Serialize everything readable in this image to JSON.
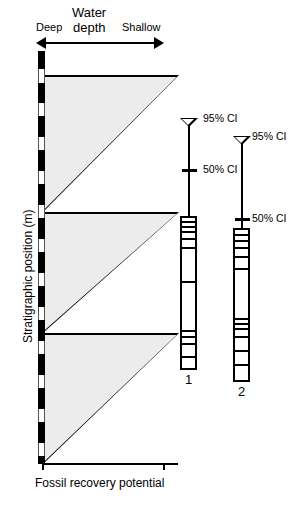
{
  "figure": {
    "axes": {
      "x_label": "Fossil recovery potential",
      "y_label": "Stratigraphic position (m)",
      "gradient_label_line1": "Water",
      "gradient_label_line2": "depth",
      "gradient_left": "Deep",
      "gradient_right": "Shallow"
    },
    "confidence_intervals": [
      {
        "id": "section-1",
        "ci95": "95% CI",
        "ci50": "50% CI"
      },
      {
        "id": "section-2",
        "ci95": "95% CI",
        "ci50": "50% CI"
      }
    ],
    "sections": [
      {
        "label": "1"
      },
      {
        "label": "2"
      }
    ]
  },
  "chart_data": {
    "type": "area",
    "title": "",
    "xlabel": "Fossil recovery potential",
    "ylabel": "Stratigraphic position (m)",
    "grid": false,
    "legend": "none",
    "annotations": [
      "Water depth",
      "Deep",
      "Shallow",
      "95% CI",
      "50% CI"
    ],
    "series": [
      {
        "name": "Fossil recovery potential (sawtooth cycle 1)",
        "type": "sawtooth-triangle",
        "top_y": 75,
        "base_y": 211,
        "max_x": 135
      },
      {
        "name": "Fossil recovery potential (sawtooth cycle 2)",
        "type": "sawtooth-triangle",
        "top_y": 212,
        "base_y": 332,
        "max_x": 135
      },
      {
        "name": "Fossil recovery potential (sawtooth cycle 3)",
        "type": "sawtooth-triangle",
        "top_y": 333,
        "base_y": 463,
        "max_x": 135
      }
    ],
    "strat_column_segments": [
      {
        "tone": "dark",
        "top": 0,
        "height": 18
      },
      {
        "tone": "light",
        "top": 18,
        "height": 14
      },
      {
        "tone": "dark",
        "top": 32,
        "height": 20
      },
      {
        "tone": "light",
        "top": 52,
        "height": 13
      },
      {
        "tone": "dark",
        "top": 65,
        "height": 21
      },
      {
        "tone": "light",
        "top": 86,
        "height": 13
      },
      {
        "tone": "dark",
        "top": 99,
        "height": 21
      },
      {
        "tone": "light",
        "top": 120,
        "height": 13
      },
      {
        "tone": "dark",
        "top": 133,
        "height": 21
      },
      {
        "tone": "light",
        "top": 154,
        "height": 13
      },
      {
        "tone": "dark",
        "top": 167,
        "height": 21
      },
      {
        "tone": "light",
        "top": 188,
        "height": 13
      },
      {
        "tone": "dark",
        "top": 201,
        "height": 21
      },
      {
        "tone": "light",
        "top": 222,
        "height": 13
      },
      {
        "tone": "dark",
        "top": 235,
        "height": 21
      },
      {
        "tone": "light",
        "top": 256,
        "height": 13
      },
      {
        "tone": "dark",
        "top": 269,
        "height": 21
      },
      {
        "tone": "light",
        "top": 290,
        "height": 13
      },
      {
        "tone": "dark",
        "top": 303,
        "height": 21
      },
      {
        "tone": "light",
        "top": 324,
        "height": 13
      },
      {
        "tone": "dark",
        "top": 337,
        "height": 21
      },
      {
        "tone": "light",
        "top": 358,
        "height": 13
      },
      {
        "tone": "dark",
        "top": 371,
        "height": 21
      },
      {
        "tone": "light",
        "top": 392,
        "height": 13
      },
      {
        "tone": "dark",
        "top": 405,
        "height": 8
      }
    ],
    "section_1": {
      "top": 216,
      "bottom": 370,
      "left": 180,
      "width": 17,
      "bed_boundaries_y": [
        221,
        226,
        231,
        238,
        247,
        281,
        330,
        336,
        343,
        356
      ]
    },
    "section_2": {
      "top": 228,
      "bottom": 382,
      "left": 233,
      "width": 17,
      "bed_boundaries_y": [
        234,
        240,
        247,
        256,
        268,
        318,
        323,
        328,
        336,
        350,
        364
      ]
    },
    "ci_markers": [
      {
        "section": "1",
        "stem_x": 188,
        "stem_top": 122,
        "stem_bottom": 216,
        "ci95_y": 118,
        "ci50_y": 169
      },
      {
        "section": "2",
        "stem_x": 241,
        "stem_top": 140,
        "stem_bottom": 228,
        "ci95_y": 136,
        "ci50_y": 218
      }
    ]
  }
}
